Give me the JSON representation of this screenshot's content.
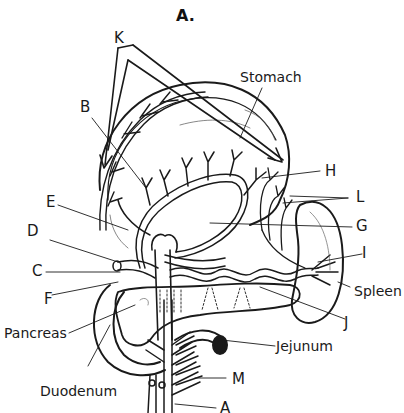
{
  "figure": {
    "title": "A.",
    "line_color": "#1a1a1a",
    "background": "#ffffff"
  },
  "labels": {
    "K": "K",
    "B": "B",
    "stomach": "Stomach",
    "E": "E",
    "D": "D",
    "C": "C",
    "F": "F",
    "H": "H",
    "L": "L",
    "G": "G",
    "I": "I",
    "spleen": "Spleen",
    "J": "J",
    "pancreas": "Pancreas",
    "jejunum": "Jejunum",
    "duodenum": "Duodenum",
    "M": "M",
    "A": "A"
  }
}
